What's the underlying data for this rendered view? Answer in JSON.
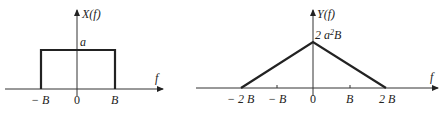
{
  "panels": [
    {
      "id": "x-spectrum",
      "y_label": "X(f)",
      "x_label": "f",
      "amplitude_label": "a",
      "ticks": [
        "− B",
        "0",
        "B"
      ],
      "shape": "rectangle",
      "points": [
        [
          -1,
          0
        ],
        [
          -1,
          1
        ],
        [
          1,
          1
        ],
        [
          1,
          0
        ]
      ]
    },
    {
      "id": "y-spectrum",
      "y_label": "Y(f)",
      "x_label": "f",
      "peak_label_prefix": "2 a",
      "peak_label_sup": "2",
      "peak_label_suffix": "B",
      "ticks": [
        "− 2 B",
        "− B",
        "0",
        "B",
        "2 B"
      ],
      "shape": "triangle",
      "points": [
        [
          -2,
          0
        ],
        [
          0,
          1
        ],
        [
          2,
          0
        ]
      ]
    }
  ]
}
